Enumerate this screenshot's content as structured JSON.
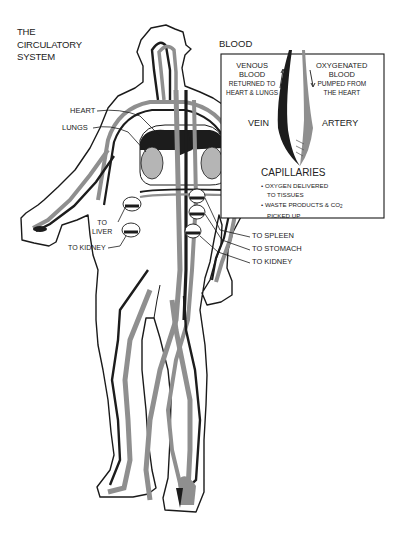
{
  "title": {
    "line1": "THE",
    "line2": "CIRCULATORY",
    "line3": "SYSTEM"
  },
  "inset": {
    "heading": "BLOOD",
    "venous": {
      "line1": "VENOUS",
      "line2": "BLOOD",
      "line3": "RETURNED TO",
      "line4": "HEART & LUNGS"
    },
    "oxygenated": {
      "line1": "OXYGENATED",
      "line2": "BLOOD",
      "line3": "PUMPED FROM",
      "line4": "THE HEART"
    },
    "vein_label": "VEIN",
    "artery_label": "ARTERY",
    "capillaries": {
      "heading": "CAPILLARIES",
      "items": [
        {
          "line1": "• OXYGEN DELIVERED",
          "line2": "TO TISSUES"
        },
        {
          "line1": "• WASTE PRODUCTS & CO",
          "sub": "2",
          "line2": "PICKED UP"
        }
      ]
    }
  },
  "callouts": {
    "heart": "HEART",
    "lungs": "LUNGS",
    "liver_line1": "TO",
    "liver_line2": "LIVER",
    "kidney_left": "TO KIDNEY",
    "spleen": "TO SPLEEN",
    "stomach": "TO STOMACH",
    "kidney_right": "TO KIDNEY"
  },
  "colors": {
    "outline": "#1a1a1a",
    "vein": "#1c1c1c",
    "artery": "#8f8f8f",
    "organ_fill": "#b5b5b5",
    "background": "#ffffff"
  }
}
